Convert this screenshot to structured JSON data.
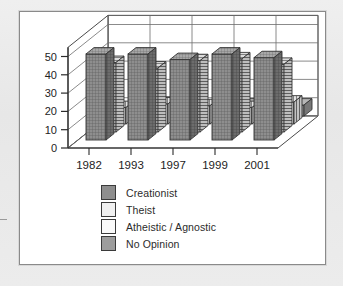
{
  "chart_data": {
    "type": "bar",
    "title": "",
    "subtitle": "",
    "xlabel": "",
    "ylabel": "",
    "categories": [
      "1982",
      "1993",
      "1997",
      "1999",
      "2001"
    ],
    "ylim": [
      0,
      55
    ],
    "yticks": [
      0,
      10,
      20,
      30,
      40,
      50
    ],
    "ytick_labels": [
      "0",
      "10",
      "20",
      "30",
      "40",
      "50"
    ],
    "grid": true,
    "three_d": true,
    "legend_position": "bottom",
    "series": [
      {
        "name": "Creationist",
        "pattern": "crosshatch",
        "color": "#8e8e8e",
        "values": [
          47,
          47,
          44,
          47,
          45
        ]
      },
      {
        "name": "Theist",
        "pattern": "horizontal-lines",
        "color": "#f0f0f0",
        "values": [
          38,
          35,
          39,
          40,
          37
        ]
      },
      {
        "name": "Atheistic / Agnostic",
        "pattern": "vertical-lines",
        "color": "#fafafa",
        "values": [
          9,
          11,
          10,
          9,
          12
        ]
      },
      {
        "name": "No Opinion",
        "pattern": "solid",
        "color": "#9d9d9d",
        "values": [
          4,
          7,
          4,
          6,
          6
        ]
      }
    ]
  },
  "legend": {
    "items": [
      {
        "label": "Creationist"
      },
      {
        "label": "Theist"
      },
      {
        "label": "Atheistic / Agnostic"
      },
      {
        "label": "No Opinion"
      }
    ]
  },
  "axes": {
    "y_tick_labels": [
      "50",
      "40",
      "30",
      "20",
      "10",
      "0"
    ],
    "x_tick_labels": [
      "1982",
      "1993",
      "1997",
      "1999",
      "2001"
    ]
  }
}
